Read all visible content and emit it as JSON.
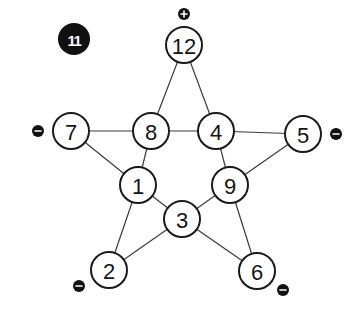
{
  "puzzle": {
    "number": "11",
    "label_position": {
      "x": 74,
      "y": 39,
      "r": 16
    }
  },
  "colors": {
    "node_fill": "#ffffff",
    "node_stroke": "#1a1a1a",
    "edge": "#3a3a3a",
    "badge": "#111111"
  },
  "node_radius": 18,
  "nodes": [
    {
      "id": "n12",
      "value": "12",
      "x": 184,
      "y": 45,
      "sign": "+",
      "sign_x": 184,
      "sign_y": 14
    },
    {
      "id": "n7",
      "value": "7",
      "x": 71,
      "y": 131,
      "sign": "-",
      "sign_x": 38,
      "sign_y": 131
    },
    {
      "id": "n8",
      "value": "8",
      "x": 151,
      "y": 131,
      "sign": null
    },
    {
      "id": "n4",
      "value": "4",
      "x": 216,
      "y": 131,
      "sign": null
    },
    {
      "id": "n5",
      "value": "5",
      "x": 303,
      "y": 134,
      "sign": "-",
      "sign_x": 336,
      "sign_y": 134
    },
    {
      "id": "n1",
      "value": "1",
      "x": 138,
      "y": 185,
      "sign": null
    },
    {
      "id": "n9",
      "value": "9",
      "x": 230,
      "y": 185,
      "sign": null
    },
    {
      "id": "n3",
      "value": "3",
      "x": 182,
      "y": 219,
      "sign": null
    },
    {
      "id": "n2",
      "value": "2",
      "x": 109,
      "y": 270,
      "sign": "-",
      "sign_x": 79,
      "sign_y": 286
    },
    {
      "id": "n6",
      "value": "6",
      "x": 257,
      "y": 271,
      "sign": "-",
      "sign_x": 283,
      "sign_y": 290
    }
  ],
  "edges": [
    [
      "n12",
      "n8"
    ],
    [
      "n12",
      "n4"
    ],
    [
      "n7",
      "n8"
    ],
    [
      "n8",
      "n4"
    ],
    [
      "n4",
      "n5"
    ],
    [
      "n7",
      "n1"
    ],
    [
      "n8",
      "n1"
    ],
    [
      "n4",
      "n9"
    ],
    [
      "n5",
      "n9"
    ],
    [
      "n1",
      "n3"
    ],
    [
      "n9",
      "n3"
    ],
    [
      "n1",
      "n2"
    ],
    [
      "n2",
      "n3"
    ],
    [
      "n3",
      "n6"
    ],
    [
      "n9",
      "n6"
    ]
  ]
}
